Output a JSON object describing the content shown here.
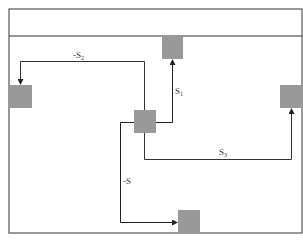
{
  "diagram": {
    "colors": {
      "frame": "#555555",
      "box": "#999999",
      "line": "#333333",
      "background": "#ffffff"
    },
    "frame": {
      "x": 9,
      "y": 9,
      "width": 293,
      "height": 224,
      "header_divider_y": 36
    },
    "nodes": [
      {
        "id": "center",
        "x": 134,
        "y": 110,
        "w": 22,
        "h": 23
      },
      {
        "id": "top",
        "x": 162,
        "y": 36,
        "w": 21,
        "h": 23
      },
      {
        "id": "left",
        "x": 9,
        "y": 85,
        "w": 23,
        "h": 23
      },
      {
        "id": "right",
        "x": 280,
        "y": 85,
        "w": 22,
        "h": 23
      },
      {
        "id": "bottom",
        "x": 178,
        "y": 210,
        "w": 22,
        "h": 23
      }
    ],
    "edges": [
      {
        "id": "edge-neg-s2",
        "from": "center",
        "to": "left",
        "label": "-S",
        "subscript": "2"
      },
      {
        "id": "edge-s1",
        "from": "center",
        "to": "top",
        "label": "S",
        "subscript": "1"
      },
      {
        "id": "edge-s3",
        "from": "center",
        "to": "right",
        "label": "S",
        "subscript": "3"
      },
      {
        "id": "edge-neg-s",
        "from": "center",
        "to": "bottom",
        "label": "-S",
        "subscript": ""
      }
    ]
  }
}
